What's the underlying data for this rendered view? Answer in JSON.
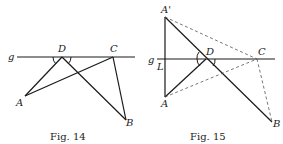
{
  "figures": [
    {
      "id": "fig14",
      "caption": "Fig. 14",
      "labels": {
        "g": "g",
        "D": "D",
        "C": "C",
        "A": "A",
        "B": "B"
      },
      "points": {
        "A": [
          25,
          96
        ],
        "B": [
          126,
          120
        ],
        "C": [
          113,
          57
        ],
        "D": [
          62,
          57
        ]
      },
      "line_g": {
        "x1": 17,
        "x2": 135,
        "y": 57
      },
      "solid_segments": [
        [
          "A",
          "D"
        ],
        [
          "A",
          "C"
        ],
        [
          "D",
          "B"
        ],
        [
          "C",
          "B"
        ]
      ],
      "dashed_segments": []
    },
    {
      "id": "fig15",
      "caption": "Fig. 15",
      "labels": {
        "g": "g",
        "L": "L",
        "A_prime": "A'",
        "D": "D",
        "C": "C",
        "A": "A",
        "B": "B"
      },
      "points": {
        "A_prime": [
          165,
          17
        ],
        "A": [
          165,
          97
        ],
        "B": [
          272,
          122
        ],
        "C": [
          257,
          59
        ],
        "D": [
          206,
          59
        ],
        "L": [
          165,
          59
        ]
      },
      "line_g": {
        "x1": 157,
        "x2": 275,
        "y": 59
      },
      "solid_segments": [
        [
          "A_prime",
          "A"
        ],
        [
          "A_prime",
          "B"
        ],
        [
          "A",
          "D"
        ]
      ],
      "dashed_segments": [
        [
          "A_prime",
          "C"
        ],
        [
          "A",
          "C"
        ],
        [
          "C",
          "B"
        ]
      ]
    }
  ]
}
